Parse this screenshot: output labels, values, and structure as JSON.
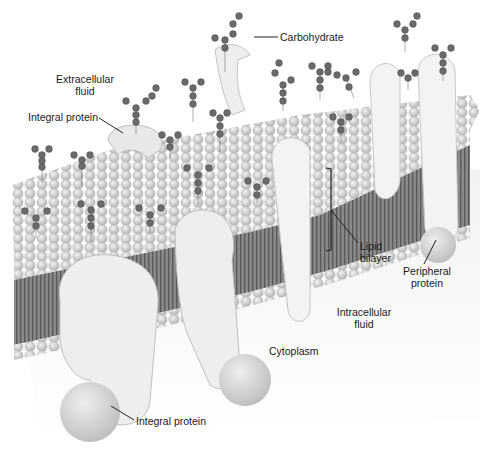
{
  "diagram": {
    "labels": {
      "carbohydrate": "Carbohydrate",
      "extracellular_line1": "Extracellular",
      "extracellular_line2": "fluid",
      "integral_protein_top": "Integral protein",
      "lipid_line1": "Lipid",
      "lipid_line2": "bilayer",
      "peripheral_line1": "Peripheral",
      "peripheral_line2": "protein",
      "intracellular_line1": "Intracellular",
      "intracellular_line2": "fluid",
      "cytoplasm": "Cytoplasm",
      "integral_protein_bottom": "Integral protein"
    },
    "colors": {
      "background": "#ffffff",
      "head_fill": "#d6d6d6",
      "head_stroke": "#a9a9a9",
      "tail_fill": "#6e6e6e",
      "protein_fill": "#ececec",
      "protein_stroke": "#bdbdbd",
      "sugar_fill": "#6a6a6a",
      "leader_line": "#222222",
      "text": "#1a1a1a"
    }
  }
}
